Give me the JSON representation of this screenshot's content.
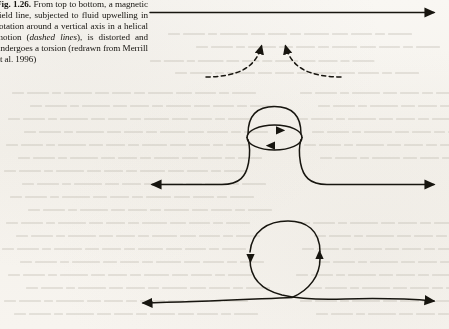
{
  "figure": {
    "label": "Fig. 1.26.",
    "caption_part_1": " From top to bottom, a magnetic field line, subjected to fluid upwelling in rotation around a vertical axis in a helical motion (",
    "caption_emphasis": "dashed lines",
    "caption_part_2": "), is distorted and undergoes a torsion (redrawn from Merrill et al. 1996)",
    "ink_color": "#17150f",
    "paper_color": "#fbfaf8",
    "bleed_color": "#b8b3a8"
  },
  "diagram": {
    "stages": [
      {
        "name": "undisturbed-field-line",
        "description": "Straight horizontal magnetic field line directed to the right",
        "order": 1
      },
      {
        "name": "distorted-field-line",
        "description": "Field line pushed upward into a bulge and rotated about a vertical axis",
        "order": 2
      },
      {
        "name": "torsioned-field-line",
        "description": "Field line twisted into a self-crossing loop, forming a torsion",
        "order": 3
      }
    ],
    "flow": {
      "name": "upwelling-flow",
      "description": "Dashed lines indicating fluid upwelling converging and rising",
      "style": "dashed",
      "arrow_count": 2
    },
    "rotation": {
      "name": "rotation-ellipse",
      "description": "Horizontal ellipse with opposing arrowheads showing rotation about the vertical axis",
      "arrow_back": "right",
      "arrow_front": "left"
    },
    "field_arrows": {
      "top": 1,
      "middle": 2,
      "bottom": 2,
      "direction": "right"
    }
  }
}
